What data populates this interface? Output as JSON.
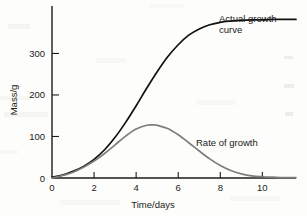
{
  "chart_data": {
    "type": "line",
    "title": "",
    "xlabel": "Time/days",
    "ylabel": "Mass/g",
    "xlim": [
      0,
      11.6
    ],
    "ylim": [
      0,
      395
    ],
    "xticks": [
      0,
      2,
      4,
      6,
      8,
      10
    ],
    "xtick_labels": [
      "0",
      "2",
      "4",
      "6",
      "8",
      "10"
    ],
    "yticks": [
      0,
      100,
      200,
      300
    ],
    "ytick_labels": [
      "0",
      "100",
      "200",
      "300"
    ],
    "grid": false,
    "legend_position": "inline-annotations",
    "series": [
      {
        "name": "Actual growth curve",
        "color": "#111111",
        "x": [
          0,
          0.5,
          1,
          1.5,
          2,
          2.5,
          3,
          3.5,
          4,
          4.5,
          5,
          5.5,
          6,
          6.5,
          7,
          7.5,
          8,
          8.5,
          9,
          9.5,
          10,
          10.5,
          11,
          11.6
        ],
        "y": [
          2,
          7,
          16,
          28,
          45,
          68,
          98,
          134,
          174,
          216,
          256,
          292,
          321,
          344,
          359,
          369,
          375,
          378,
          380,
          381,
          381,
          382,
          382,
          382
        ]
      },
      {
        "name": "Rate of growth",
        "color": "#7d7d7d",
        "x": [
          0,
          0.5,
          1,
          1.5,
          2,
          2.5,
          3,
          3.5,
          4,
          4.5,
          4.8,
          5,
          5.5,
          6,
          6.5,
          7,
          7.5,
          8,
          8.5,
          9,
          9.5,
          10,
          10.5,
          11,
          11.6
        ],
        "y": [
          0,
          6,
          14,
          26,
          41,
          59,
          80,
          101,
          118,
          127,
          128,
          127,
          119,
          104,
          85,
          65,
          46,
          30,
          18,
          10,
          5,
          3,
          2,
          1,
          1
        ]
      }
    ],
    "annotations": [
      {
        "id": "actual-growth-label",
        "lines": [
          "Actual growth",
          "curve"
        ],
        "x": 219,
        "y": 22
      },
      {
        "id": "rate-of-growth-label",
        "lines": [
          "Rate of growth"
        ],
        "x": 196,
        "y": 146
      }
    ]
  }
}
